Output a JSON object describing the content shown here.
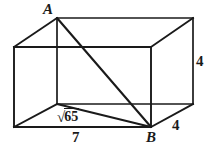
{
  "figure": {
    "kind": "geometry-diagram",
    "shape": "rectangular-prism",
    "stroke_color": "#1a1a1a",
    "background_color": "#ffffff",
    "canvas": {
      "width": 212,
      "height": 153
    }
  },
  "vertex_labels": {
    "a": "A",
    "b": "B"
  },
  "measure_labels": {
    "right_height": "4",
    "depth": "4",
    "bottom_width": "7",
    "diagonal_radicand": "65",
    "diagonal_radical_sign": "√"
  },
  "geometry": {
    "front_face": {
      "top_left": [
        14,
        47
      ],
      "top_right": [
        151,
        47
      ],
      "bottom_right": [
        151,
        127
      ],
      "bottom_left": [
        14,
        127
      ]
    },
    "back_face": {
      "top_left": [
        57,
        18
      ],
      "top_right": [
        193,
        18
      ],
      "bottom_right": [
        193,
        104
      ],
      "bottom_left": [
        57,
        104
      ]
    },
    "diagonal_A_to_B": [
      [
        57,
        18
      ],
      [
        151,
        127
      ]
    ],
    "base_edge_to_B": [
      [
        57,
        104
      ],
      [
        151,
        127
      ]
    ]
  }
}
